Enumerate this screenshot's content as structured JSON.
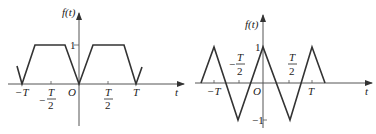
{
  "figures": [
    {
      "id": "left",
      "ylabel": "f(t)",
      "xlabel": "t",
      "origin_label": "O",
      "y_tick": "1",
      "x_ticks": [
        {
          "label": "-T",
          "pos": -1
        },
        {
          "label": "-T/2",
          "num": "T",
          "den": "2",
          "neg": true,
          "pos": -0.5
        },
        {
          "label": "T/2",
          "num": "T",
          "den": "2",
          "neg": false,
          "pos": 0.5
        },
        {
          "label": "T",
          "pos": 1
        }
      ],
      "waveform": "trapezoidal",
      "polyline": [
        [
          -1.1,
          0.6
        ],
        [
          -1,
          0
        ],
        [
          -0.75,
          1
        ],
        [
          -0.25,
          1
        ],
        [
          0,
          0
        ],
        [
          0.25,
          1
        ],
        [
          0.75,
          1
        ],
        [
          1,
          0
        ],
        [
          1.1,
          0.6
        ]
      ]
    },
    {
      "id": "right",
      "ylabel": "f(t)",
      "xlabel": "t",
      "origin_label": "O",
      "y_ticks": [
        "1",
        "-1"
      ],
      "x_ticks": [
        {
          "label": "-T",
          "pos": -1
        },
        {
          "label": "-T/2",
          "num": "T",
          "den": "2",
          "neg": true,
          "pos": -0.5
        },
        {
          "label": "T/2",
          "num": "T",
          "den": "2",
          "neg": false,
          "pos": 0.5
        },
        {
          "label": "T",
          "pos": 1
        }
      ],
      "waveform": "triangular",
      "polyline": [
        [
          -1.25,
          0
        ],
        [
          -1,
          1
        ],
        [
          -0.5,
          -1
        ],
        [
          0,
          1
        ],
        [
          0.5,
          -1
        ],
        [
          1,
          1
        ],
        [
          1.25,
          0
        ]
      ]
    }
  ]
}
